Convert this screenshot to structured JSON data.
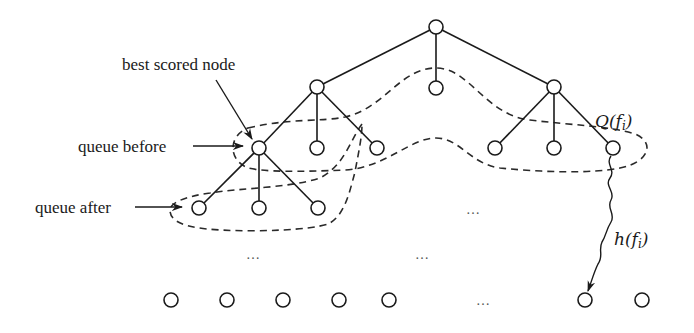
{
  "labels": {
    "best_scored_node": "best scored node",
    "queue_before": "queue before",
    "queue_after": "queue after",
    "queue_fn": "Q(f",
    "queue_fn_sub": "i",
    "queue_fn_close": ")",
    "heuristic_fn": "h(f",
    "heuristic_fn_sub": "i",
    "heuristic_fn_close": ")"
  },
  "ellipses": [
    "…",
    "…",
    "…",
    "…"
  ],
  "tree": {
    "root": {
      "x": 436,
      "y": 27
    },
    "level1": [
      {
        "id": "left",
        "x": 317,
        "y": 87
      },
      {
        "id": "middle",
        "x": 436,
        "y": 88
      },
      {
        "id": "right",
        "x": 554,
        "y": 87
      }
    ],
    "level2": [
      {
        "id": "best",
        "parent": "left",
        "x": 259,
        "y": 148
      },
      {
        "parent": "left",
        "x": 317,
        "y": 148
      },
      {
        "parent": "left",
        "x": 377,
        "y": 148
      },
      {
        "parent": "right",
        "x": 495,
        "y": 148
      },
      {
        "parent": "right",
        "x": 554,
        "y": 148
      },
      {
        "parent": "right",
        "x": 613,
        "y": 148
      }
    ],
    "level3": [
      {
        "parent": "best",
        "x": 199,
        "y": 208
      },
      {
        "parent": "best",
        "x": 259,
        "y": 208
      },
      {
        "parent": "best",
        "x": 318,
        "y": 208
      }
    ],
    "leaves": [
      {
        "x": 171,
        "y": 300
      },
      {
        "x": 227,
        "y": 300
      },
      {
        "x": 283,
        "y": 300
      },
      {
        "x": 339,
        "y": 300
      },
      {
        "x": 389,
        "y": 300
      },
      {
        "x": 585,
        "y": 300
      },
      {
        "x": 642,
        "y": 300
      }
    ]
  },
  "colors": {
    "line": "#1a1a1a",
    "background": "#ffffff"
  }
}
